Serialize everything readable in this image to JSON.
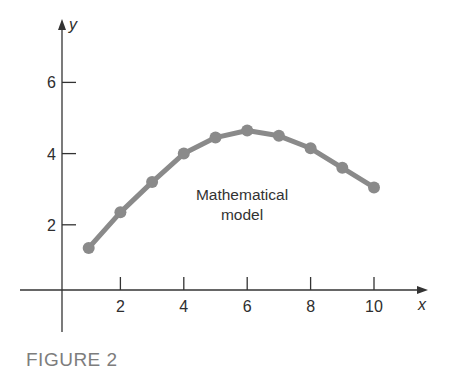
{
  "caption": "FIGURE 2",
  "annotation": {
    "line1": "Mathematical",
    "line2": "model"
  },
  "axes": {
    "x_label": "x",
    "y_label": "y"
  },
  "colors": {
    "axis": "#333333",
    "curve": "#8a8a8a",
    "caption": "#7d7d7d"
  },
  "chart_data": {
    "type": "line",
    "title": "",
    "xlabel": "x",
    "ylabel": "y",
    "x": [
      1,
      2,
      3,
      4,
      5,
      6,
      7,
      8,
      9,
      10
    ],
    "series": [
      {
        "name": "Mathematical model",
        "values": [
          1.35,
          2.35,
          3.2,
          4.0,
          4.45,
          4.65,
          4.5,
          4.15,
          3.6,
          3.05
        ]
      }
    ],
    "x_ticks": [
      2,
      4,
      6,
      8,
      10
    ],
    "y_ticks": [
      2,
      4,
      6
    ],
    "xlim": [
      0,
      11
    ],
    "ylim": [
      0,
      7.5
    ],
    "grid": false,
    "legend": "none",
    "annotations": [
      "Mathematical model"
    ],
    "markers": true
  }
}
